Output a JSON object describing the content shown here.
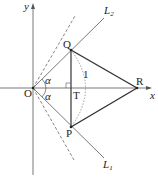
{
  "labels": {
    "y_axis": "y",
    "x_axis": "x",
    "origin": "O",
    "Q": "Q",
    "P": "P",
    "R": "R",
    "T": "T",
    "L2": "L",
    "L2_sub": "2",
    "L1": "L",
    "L1_sub": "1",
    "alpha_top": "α",
    "alpha_bottom": "α",
    "radius": "1"
  }
}
